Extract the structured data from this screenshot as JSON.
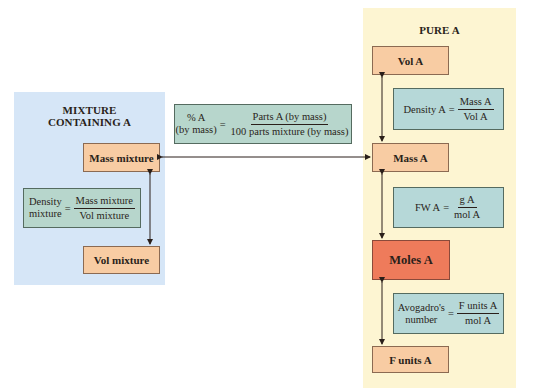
{
  "mixture_panel": {
    "title_line1": "MIXTURE",
    "title_line2": "CONTAINING A",
    "mass_box": "Mass mixture",
    "vol_box": "Vol mixture",
    "density_formula": {
      "lhs_line1": "Density",
      "lhs_line2": "mixture",
      "equals": "=",
      "numerator": "Mass mixture",
      "denominator": "Vol mixture"
    }
  },
  "percent_formula": {
    "lhs_line1": "% A",
    "lhs_line2": "(by mass)",
    "equals": "=",
    "numerator": "Parts A (by mass)",
    "denominator": "100 parts mixture (by mass)"
  },
  "pure_panel": {
    "title": "PURE A",
    "vol_box": "Vol A",
    "mass_box": "Mass A",
    "moles_box": "Moles A",
    "funits_box": "F units A",
    "density_formula": {
      "lhs": "Density A",
      "equals": "=",
      "numerator": "Mass A",
      "denominator": "Vol A"
    },
    "fw_formula": {
      "lhs": "FW A",
      "equals": "=",
      "numerator": "g A",
      "denominator": "mol A"
    },
    "avogadro_formula": {
      "lhs_line1": "Avogadro's",
      "lhs_line2": "number",
      "equals": "=",
      "numerator": "F units A",
      "denominator": "mol A"
    }
  },
  "colors": {
    "mixture_panel_bg": "#d6e6f7",
    "pure_panel_bg": "#fdf5d2",
    "quantity_box": "#f8cca3",
    "moles_box": "#ee7b5b",
    "formula_box": "#b7d6cc"
  }
}
